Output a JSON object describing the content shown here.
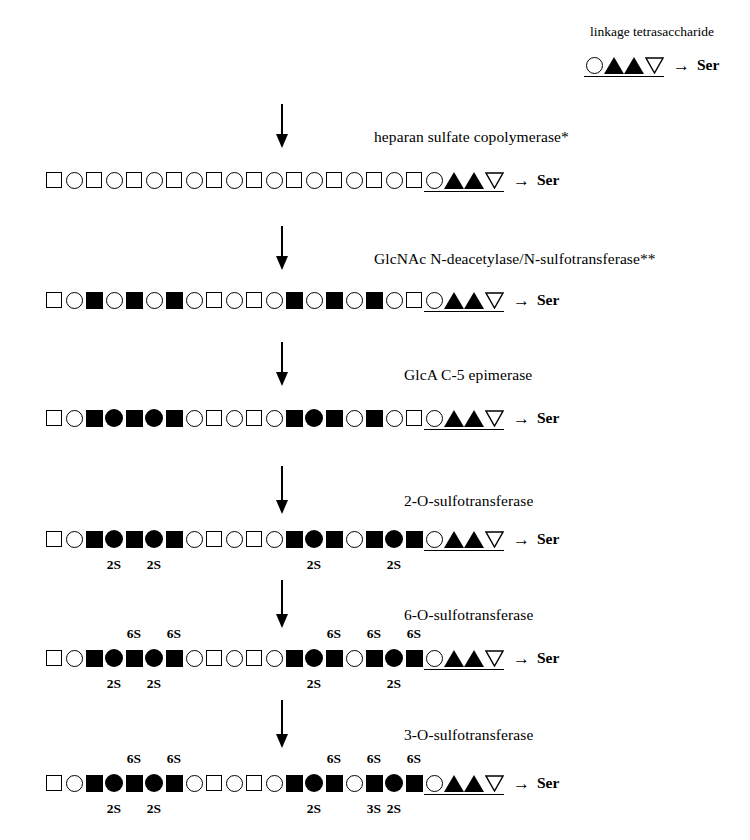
{
  "figure": {
    "type": "biosynthesis-pathway-diagram",
    "title_text": "linkage tetrasaccharide",
    "terminal_residue": "Ser",
    "arrow_glyph": "→",
    "colors": {
      "ink": "#000000",
      "background": "#ffffff"
    }
  },
  "legend": {
    "tetrasaccharide_label": "linkage tetrasaccharide",
    "symbols": [
      "circle-open",
      "triangle-up-filled",
      "triangle-up-filled",
      "triangle-down-open"
    ],
    "terminus": "Ser"
  },
  "steps": [
    {
      "id": "step-1",
      "enzyme": "heparan sulfate copolymerase*"
    },
    {
      "id": "step-2",
      "enzyme": "GlcNAc N-deacetylase/N-sulfotransferase**"
    },
    {
      "id": "step-3",
      "enzyme": "GlcA C-5 epimerase"
    },
    {
      "id": "step-4",
      "enzyme": "2-O-sulfotransferase"
    },
    {
      "id": "step-5",
      "enzyme": "6-O-sulfotransferase"
    },
    {
      "id": "step-6",
      "enzyme": "3-O-sulfotransferase"
    }
  ],
  "chains": [
    {
      "id": "chain-1",
      "after_enzyme": "heparan sulfate copolymerase*",
      "units": [
        {
          "shape": "square-open"
        },
        {
          "shape": "circle-open"
        },
        {
          "shape": "square-open"
        },
        {
          "shape": "circle-open"
        },
        {
          "shape": "square-open"
        },
        {
          "shape": "circle-open"
        },
        {
          "shape": "square-open"
        },
        {
          "shape": "circle-open"
        },
        {
          "shape": "square-open"
        },
        {
          "shape": "circle-open"
        },
        {
          "shape": "square-open"
        },
        {
          "shape": "circle-open"
        },
        {
          "shape": "square-open"
        },
        {
          "shape": "circle-open"
        },
        {
          "shape": "square-open"
        },
        {
          "shape": "circle-open"
        },
        {
          "shape": "square-open"
        },
        {
          "shape": "circle-open"
        },
        {
          "shape": "square-open"
        }
      ],
      "terminus": "Ser"
    },
    {
      "id": "chain-2",
      "after_enzyme": "GlcNAc N-deacetylase/N-sulfotransferase**",
      "units": [
        {
          "shape": "square-open"
        },
        {
          "shape": "circle-open"
        },
        {
          "shape": "square-filled"
        },
        {
          "shape": "circle-open"
        },
        {
          "shape": "square-filled"
        },
        {
          "shape": "circle-open"
        },
        {
          "shape": "square-filled"
        },
        {
          "shape": "circle-open"
        },
        {
          "shape": "square-open"
        },
        {
          "shape": "circle-open"
        },
        {
          "shape": "square-open"
        },
        {
          "shape": "circle-open"
        },
        {
          "shape": "square-filled"
        },
        {
          "shape": "circle-open"
        },
        {
          "shape": "square-filled"
        },
        {
          "shape": "circle-open"
        },
        {
          "shape": "square-filled"
        },
        {
          "shape": "circle-open"
        },
        {
          "shape": "square-open"
        }
      ],
      "terminus": "Ser"
    },
    {
      "id": "chain-3",
      "after_enzyme": "GlcA C-5 epimerase",
      "units": [
        {
          "shape": "square-open"
        },
        {
          "shape": "circle-open"
        },
        {
          "shape": "square-filled"
        },
        {
          "shape": "circle-filled"
        },
        {
          "shape": "square-filled"
        },
        {
          "shape": "circle-filled"
        },
        {
          "shape": "square-filled"
        },
        {
          "shape": "circle-open"
        },
        {
          "shape": "square-open"
        },
        {
          "shape": "circle-open"
        },
        {
          "shape": "square-open"
        },
        {
          "shape": "circle-open"
        },
        {
          "shape": "square-filled"
        },
        {
          "shape": "circle-filled"
        },
        {
          "shape": "square-filled"
        },
        {
          "shape": "circle-open"
        },
        {
          "shape": "square-filled"
        },
        {
          "shape": "circle-open"
        },
        {
          "shape": "square-open"
        }
      ],
      "terminus": "Ser"
    },
    {
      "id": "chain-4",
      "after_enzyme": "2-O-sulfotransferase",
      "units": [
        {
          "shape": "square-open"
        },
        {
          "shape": "circle-open"
        },
        {
          "shape": "square-filled"
        },
        {
          "shape": "circle-filled",
          "below": "2S"
        },
        {
          "shape": "square-filled"
        },
        {
          "shape": "circle-filled",
          "below": "2S"
        },
        {
          "shape": "square-filled"
        },
        {
          "shape": "circle-open"
        },
        {
          "shape": "square-open"
        },
        {
          "shape": "circle-open"
        },
        {
          "shape": "square-open"
        },
        {
          "shape": "circle-open"
        },
        {
          "shape": "square-filled"
        },
        {
          "shape": "circle-filled",
          "below": "2S"
        },
        {
          "shape": "square-filled"
        },
        {
          "shape": "circle-open"
        },
        {
          "shape": "square-filled"
        },
        {
          "shape": "circle-filled",
          "below": "2S"
        },
        {
          "shape": "square-filled"
        }
      ],
      "terminus": "Ser"
    },
    {
      "id": "chain-5",
      "after_enzyme": "6-O-sulfotransferase",
      "units": [
        {
          "shape": "square-open"
        },
        {
          "shape": "circle-open"
        },
        {
          "shape": "square-filled"
        },
        {
          "shape": "circle-filled",
          "below": "2S"
        },
        {
          "shape": "square-filled",
          "above": "6S"
        },
        {
          "shape": "circle-filled",
          "below": "2S"
        },
        {
          "shape": "square-filled",
          "above": "6S"
        },
        {
          "shape": "circle-open"
        },
        {
          "shape": "square-open"
        },
        {
          "shape": "circle-open"
        },
        {
          "shape": "square-open"
        },
        {
          "shape": "circle-open"
        },
        {
          "shape": "square-filled"
        },
        {
          "shape": "circle-filled",
          "below": "2S"
        },
        {
          "shape": "square-filled",
          "above": "6S"
        },
        {
          "shape": "circle-open"
        },
        {
          "shape": "square-filled",
          "above": "6S"
        },
        {
          "shape": "circle-filled",
          "below": "2S"
        },
        {
          "shape": "square-filled",
          "above": "6S"
        }
      ],
      "terminus": "Ser"
    },
    {
      "id": "chain-6",
      "after_enzyme": "3-O-sulfotransferase",
      "units": [
        {
          "shape": "square-open"
        },
        {
          "shape": "circle-open"
        },
        {
          "shape": "square-filled"
        },
        {
          "shape": "circle-filled",
          "below": "2S"
        },
        {
          "shape": "square-filled",
          "above": "6S"
        },
        {
          "shape": "circle-filled",
          "below": "2S"
        },
        {
          "shape": "square-filled",
          "above": "6S"
        },
        {
          "shape": "circle-open"
        },
        {
          "shape": "square-open"
        },
        {
          "shape": "circle-open"
        },
        {
          "shape": "square-open"
        },
        {
          "shape": "circle-open"
        },
        {
          "shape": "square-filled"
        },
        {
          "shape": "circle-filled",
          "below": "2S"
        },
        {
          "shape": "square-filled",
          "above": "6S"
        },
        {
          "shape": "circle-open"
        },
        {
          "shape": "square-filled",
          "above": "6S",
          "below": "3S"
        },
        {
          "shape": "circle-filled",
          "below": "2S"
        },
        {
          "shape": "square-filled",
          "above": "6S"
        }
      ],
      "terminus": "Ser"
    }
  ]
}
